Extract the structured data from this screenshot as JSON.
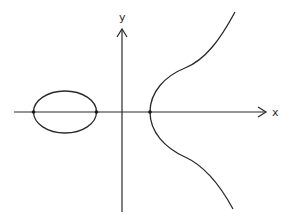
{
  "diagram": {
    "type": "elliptic-curve-plot",
    "axes": {
      "x_label": "x",
      "y_label": "y",
      "origin_px": [
        122,
        112
      ]
    },
    "components": [
      {
        "name": "oval",
        "description": "closed bounded component left of y-axis"
      },
      {
        "name": "unbounded-branch",
        "description": "open branch right of y-axis, symmetric about x-axis"
      }
    ],
    "x_intercepts": 3,
    "colors": {
      "stroke": "#2a2a2a",
      "background": "#ffffff"
    }
  }
}
